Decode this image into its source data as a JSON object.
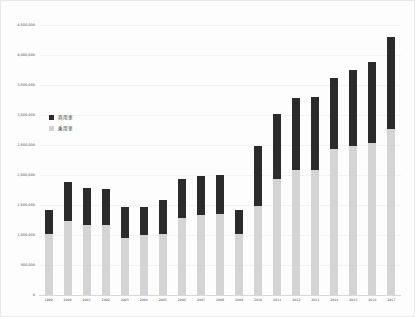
{
  "chart_data": {
    "type": "bar",
    "stacked": true,
    "title": "",
    "xlabel": "",
    "ylabel": "",
    "ylim": [
      0,
      4500000
    ],
    "grid": true,
    "legend_position": "inside-upper-left",
    "ytick_labels": [
      "4,500,000",
      "4,000,000",
      "3,500,000",
      "3,000,000",
      "2,500,000",
      "2,000,000",
      "1,500,000",
      "1,000,000",
      "500,000",
      "0"
    ],
    "ytick_values": [
      4500000,
      4000000,
      3500000,
      3000000,
      2500000,
      2000000,
      1500000,
      1000000,
      500000,
      0
    ],
    "categories": [
      "1999",
      "2000",
      "2001",
      "2002",
      "2003",
      "2004",
      "2005",
      "2006",
      "2007",
      "2008",
      "2009",
      "2010",
      "2011",
      "2012",
      "2013",
      "2014",
      "2015",
      "2016",
      "2017"
    ],
    "series": [
      {
        "name": "乗用車",
        "color": "#d4d4d4",
        "values": [
          1020000,
          1230000,
          1160000,
          1160000,
          950000,
          1000000,
          1020000,
          1280000,
          1330000,
          1350000,
          1020000,
          1480000,
          1930000,
          2090000,
          2090000,
          2440000,
          2480000,
          2530000,
          2760000
        ]
      },
      {
        "name": "商用車",
        "color": "#2b2b2b",
        "values": [
          400000,
          660000,
          620000,
          610000,
          510000,
          470000,
          570000,
          650000,
          660000,
          650000,
          400000,
          1000000,
          1090000,
          1190000,
          1210000,
          1180000,
          1270000,
          1360000,
          1540000
        ]
      }
    ],
    "totals": [
      1420000,
      1890000,
      1780000,
      1770000,
      1460000,
      1470000,
      1590000,
      1930000,
      1990000,
      2000000,
      1420000,
      2480000,
      3020000,
      3280000,
      3300000,
      3620000,
      3750000,
      3890000,
      4300000
    ]
  },
  "legend": {
    "entries": [
      {
        "label": "商用車",
        "color": "#2b2b2b"
      },
      {
        "label": "乗用車",
        "color": "#d4d4d4"
      }
    ]
  }
}
